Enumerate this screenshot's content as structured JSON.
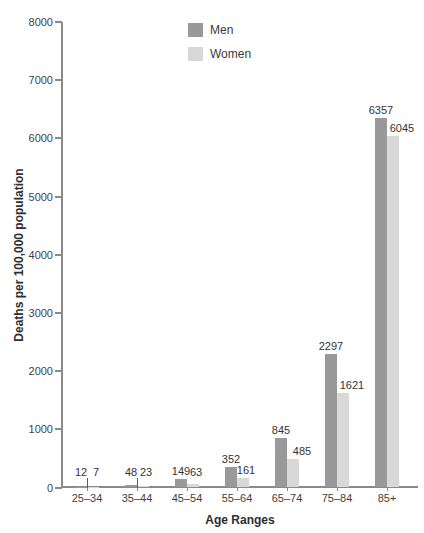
{
  "chart_data": {
    "type": "bar",
    "title": "",
    "xlabel": "Age Ranges",
    "ylabel": "Deaths per 100,000 population",
    "categories": [
      "25–34",
      "35–44",
      "45–54",
      "55–64",
      "65–74",
      "75–84",
      "85+"
    ],
    "series": [
      {
        "name": "Men",
        "color": "#999999",
        "values": [
          12,
          48,
          149,
          352,
          845,
          2297,
          6357
        ]
      },
      {
        "name": "Women",
        "color": "#d8d8d8",
        "values": [
          7,
          23,
          63,
          161,
          485,
          1621,
          6045
        ]
      }
    ],
    "ylim": [
      0,
      8000
    ],
    "yticks": [
      0,
      1000,
      2000,
      3000,
      4000,
      5000,
      6000,
      7000,
      8000
    ],
    "grid": false,
    "legend_position": "top-center",
    "bar_labels_shown": true,
    "colors": {
      "axis": "#8a8a8a",
      "text": "#3f3f3f",
      "background": "#ffffff"
    }
  }
}
